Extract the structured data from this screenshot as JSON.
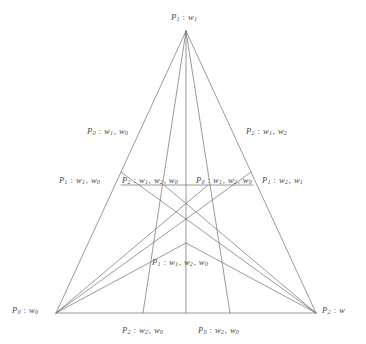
{
  "figure": {
    "background_color": "#ffffff",
    "line_color": "#6e6e6e",
    "text_color": "#4a4a4a",
    "line_width": 0.7
  },
  "vertices": {
    "apex": {
      "x": 186,
      "y": 31
    },
    "bottom_left": {
      "x": 56,
      "y": 313
    },
    "bottom_right": {
      "x": 316,
      "y": 313
    }
  },
  "points": {
    "centroid": {
      "x": 186,
      "y": 243
    },
    "left_edge_mid": {
      "x": 121,
      "y": 172
    },
    "right_edge_mid": {
      "x": 251,
      "y": 172
    },
    "midline_left": {
      "x": 121,
      "y": 185
    },
    "midline_right": {
      "x": 253,
      "y": 185
    },
    "midline_cross_left": {
      "x": 164,
      "y": 185
    },
    "midline_cross_right": {
      "x": 208,
      "y": 185
    },
    "base_third_left": {
      "x": 143,
      "y": 313
    },
    "base_third_right": {
      "x": 230,
      "y": 313
    },
    "base_mid": {
      "x": 186,
      "y": 313
    }
  },
  "labels": [
    {
      "name": "label-apex",
      "point": "P",
      "point_sub": "1",
      "weights": [
        "1"
      ],
      "x": 171,
      "y": 13,
      "align": "left"
    },
    {
      "name": "label-left-upper-edge",
      "point": "P",
      "point_sub": "0",
      "weights": [
        "1",
        "0"
      ],
      "x": 87,
      "y": 127,
      "align": "left"
    },
    {
      "name": "label-right-upper-edge",
      "point": "P",
      "point_sub": "2",
      "weights": [
        "1",
        "2"
      ],
      "x": 246,
      "y": 127,
      "align": "left"
    },
    {
      "name": "label-midline-left-end",
      "point": "P",
      "point_sub": "1",
      "weights": [
        "1",
        "0"
      ],
      "x": 59,
      "y": 176,
      "align": "left"
    },
    {
      "name": "label-midline-inner-left",
      "point": "P",
      "point_sub": "2",
      "weights": [
        "1",
        "2",
        "0"
      ],
      "x": 122,
      "y": 176,
      "align": "left"
    },
    {
      "name": "label-midline-inner-right",
      "point": "P",
      "point_sub": "0",
      "weights": [
        "1",
        "2",
        "0"
      ],
      "x": 196,
      "y": 176,
      "align": "left"
    },
    {
      "name": "label-midline-right-end",
      "point": "P",
      "point_sub": "1",
      "weights": [
        "2",
        "1"
      ],
      "x": 262,
      "y": 176,
      "align": "left"
    },
    {
      "name": "label-centroid",
      "point": "P",
      "point_sub": "1",
      "weights": [
        "1",
        "2",
        "0"
      ],
      "x": 152,
      "y": 258,
      "align": "left"
    },
    {
      "name": "label-bottom-left-vertex",
      "point": "P",
      "point_sub": "0",
      "weights": [
        "0"
      ],
      "x": 12,
      "y": 306,
      "align": "left"
    },
    {
      "name": "label-bottom-right-vertex",
      "point": "P",
      "point_sub": "2",
      "weights": [
        ""
      ],
      "x": 322,
      "y": 306,
      "align": "left"
    },
    {
      "name": "label-base-third-left",
      "point": "P",
      "point_sub": "2",
      "weights": [
        "2",
        "0"
      ],
      "x": 122,
      "y": 326,
      "align": "left"
    },
    {
      "name": "label-base-third-right",
      "point": "P",
      "point_sub": "0",
      "weights": [
        "2",
        "0"
      ],
      "x": 198,
      "y": 326,
      "align": "left"
    }
  ],
  "segments": [
    {
      "name": "triangle-left-edge",
      "x1": 186,
      "y1": 31,
      "x2": 56,
      "y2": 313
    },
    {
      "name": "triangle-right-edge",
      "x1": 186,
      "y1": 31,
      "x2": 316,
      "y2": 313
    },
    {
      "name": "triangle-base",
      "x1": 56,
      "y1": 313,
      "x2": 316,
      "y2": 313
    },
    {
      "name": "cevian-apex-to-base-third-left",
      "x1": 186,
      "y1": 31,
      "x2": 143,
      "y2": 313
    },
    {
      "name": "cevian-apex-to-base-third-right",
      "x1": 186,
      "y1": 31,
      "x2": 230,
      "y2": 313
    },
    {
      "name": "median-apex-to-base-mid",
      "x1": 186,
      "y1": 31,
      "x2": 186,
      "y2": 313
    },
    {
      "name": "cevian-bottom-left-to-right-edge-mid",
      "x1": 56,
      "y1": 313,
      "x2": 251,
      "y2": 172
    },
    {
      "name": "cevian-bottom-left-to-midline-cross-right",
      "x1": 56,
      "y1": 313,
      "x2": 208,
      "y2": 185
    },
    {
      "name": "cevian-bottom-right-to-left-edge-mid",
      "x1": 316,
      "y1": 313,
      "x2": 121,
      "y2": 172
    },
    {
      "name": "cevian-bottom-right-to-midline-cross-left",
      "x1": 316,
      "y1": 313,
      "x2": 164,
      "y2": 185
    },
    {
      "name": "midline-horizontal",
      "x1": 121,
      "y1": 185,
      "x2": 253,
      "y2": 185
    },
    {
      "name": "centroid-to-bottom-left",
      "x1": 186,
      "y1": 243,
      "x2": 56,
      "y2": 313
    },
    {
      "name": "centroid-to-bottom-right",
      "x1": 186,
      "y1": 243,
      "x2": 316,
      "y2": 313
    }
  ]
}
